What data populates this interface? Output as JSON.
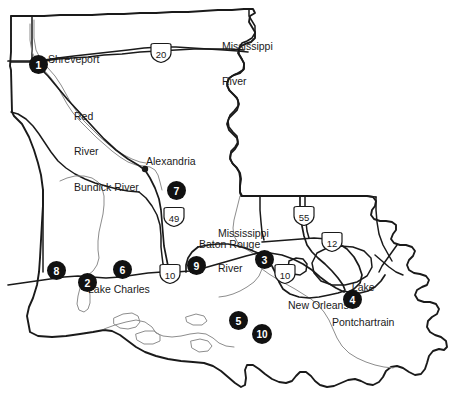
{
  "map": {
    "title": "Louisiana Reference Map",
    "region": "Louisiana",
    "background_color": "#ffffff",
    "outline_color": "#1a1a1a",
    "river_color": "#8d8d8d",
    "marker_color": "#111111",
    "marker_text_color": "#ffffff"
  },
  "cities": [
    {
      "name": "Shreveport",
      "x": 48,
      "y": 60
    },
    {
      "name": "Alexandria",
      "x": 146,
      "y": 162
    },
    {
      "name": "Baton Rouge",
      "x": 199,
      "y": 245
    },
    {
      "name": "Lake Charles",
      "x": 88,
      "y": 290
    },
    {
      "name": "New Orleans",
      "x": 288,
      "y": 306
    }
  ],
  "water_labels": [
    {
      "name": "Red River",
      "line1": "Red",
      "line2": "River",
      "x": 74,
      "y": 93
    },
    {
      "name": "Mississippi River",
      "line1": "Mississippi",
      "line2": "River",
      "x": 222,
      "y": 22
    },
    {
      "name": "Mississippi River",
      "line1": "Mississippi",
      "line2": "River",
      "x": 218,
      "y": 209
    },
    {
      "name": "Bundick River",
      "line1": "Bundick River",
      "line2": "",
      "x": 74,
      "y": 186
    },
    {
      "name": "Lake Pontchartrain",
      "line1": "Lake",
      "line2": "Pontchartrain",
      "x": 332,
      "y": 264
    }
  ],
  "highway_shields": [
    {
      "route": "20",
      "type": "interstate",
      "x": 148,
      "y": 47
    },
    {
      "route": "49",
      "type": "interstate",
      "x": 161,
      "y": 211
    },
    {
      "route": "55",
      "type": "interstate",
      "x": 291,
      "y": 210
    },
    {
      "route": "12",
      "type": "interstate",
      "x": 319,
      "y": 236
    },
    {
      "route": "10",
      "type": "interstate",
      "x": 157,
      "y": 268
    },
    {
      "route": "10",
      "type": "interstate",
      "x": 272,
      "y": 268
    }
  ],
  "numbered_markers": [
    {
      "number": "1",
      "x": 29,
      "y": 55
    },
    {
      "number": "2",
      "x": 78,
      "y": 273
    },
    {
      "number": "3",
      "x": 255,
      "y": 250
    },
    {
      "number": "4",
      "x": 343,
      "y": 290
    },
    {
      "number": "5",
      "x": 229,
      "y": 311
    },
    {
      "number": "6",
      "x": 113,
      "y": 260
    },
    {
      "number": "7",
      "x": 167,
      "y": 181
    },
    {
      "number": "8",
      "x": 47,
      "y": 261
    },
    {
      "number": "9",
      "x": 187,
      "y": 256
    },
    {
      "number": "10",
      "x": 252,
      "y": 324
    }
  ]
}
